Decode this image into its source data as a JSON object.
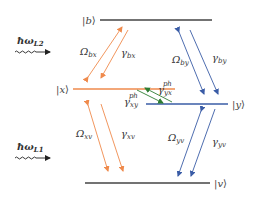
{
  "colors": {
    "orange": "#ef8a4c",
    "blue": "#3a5ca6",
    "green": "#2e7d32",
    "level_dark": "#444444",
    "level_orange": "#ef8a4c",
    "level_blue": "#3a5ca6"
  },
  "levels": {
    "b": {
      "label_main": "|",
      "label_var": "b",
      "label_end": "⟩"
    },
    "x": {
      "label_main": "|",
      "label_var": "x",
      "label_end": "⟩"
    },
    "y": {
      "label_main": "|",
      "label_var": "y",
      "label_end": "⟩"
    },
    "v": {
      "label_main": "|",
      "label_var": "v",
      "label_end": "⟩"
    }
  },
  "lasers": [
    {
      "id": "L2",
      "label_main": "ħω",
      "label_sub": "L2"
    },
    {
      "id": "L1",
      "label_main": "ħω",
      "label_sub": "L1"
    }
  ],
  "transitions": {
    "omega_bx": {
      "main": "Ω",
      "sub": "bx"
    },
    "gamma_bx": {
      "main": "γ",
      "sub": "bx"
    },
    "omega_by": {
      "main": "Ω",
      "sub": "by"
    },
    "gamma_by": {
      "main": "γ",
      "sub": "by"
    },
    "omega_xv": {
      "main": "Ω",
      "sub": "xv"
    },
    "gamma_xv": {
      "main": "γ",
      "sub": "xv"
    },
    "omega_yv": {
      "main": "Ω",
      "sub": "yv"
    },
    "gamma_yv": {
      "main": "γ",
      "sub": "yv"
    },
    "gamma_yx_ph": {
      "main": "γ",
      "sub": "yx",
      "sup": "ph"
    },
    "gamma_xy_ph": {
      "main": "γ",
      "sub": "xy",
      "sup": "ph"
    }
  }
}
